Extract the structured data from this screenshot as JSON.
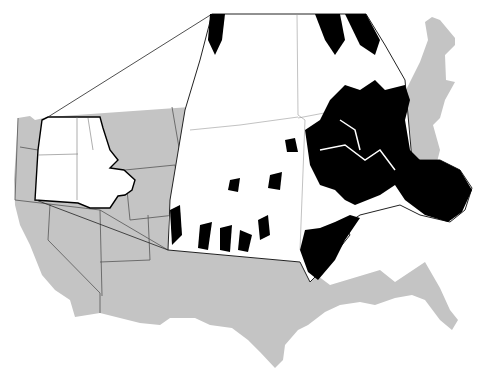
{
  "figure": {
    "type": "map",
    "colors": {
      "background": "#ffffff",
      "us_fill": "#c4c4c4",
      "state_border": "#555555",
      "study_region_fill": "#ffffff",
      "presence_fill": "#000000",
      "callout_line": "#222222"
    },
    "regions": {
      "base_map": "contiguous-us",
      "highlighted_region": "study-area-inset-source",
      "inset": "enlarged-study-area"
    },
    "legend": [],
    "labels": []
  }
}
